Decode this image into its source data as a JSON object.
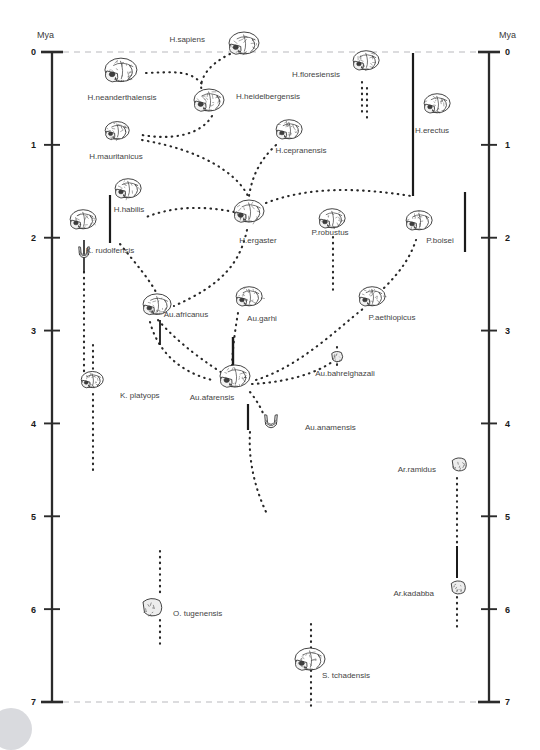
{
  "figure": {
    "kind": "hominin-phylogeny-timeline",
    "background": "#ffffff",
    "ink": "#2b2b2b",
    "label_color": "#444444",
    "axis_unit_left": "Mya",
    "axis_unit_right": "Mya"
  },
  "axes": {
    "label": "Mya",
    "ticks": [
      "0",
      "1",
      "2",
      "3",
      "4",
      "5",
      "6",
      "7"
    ],
    "min": 0,
    "max": 7,
    "left_x": 52,
    "right_x": 489,
    "top_y": 52,
    "bottom_y": 702
  },
  "chart_data": {
    "type": "scatter",
    "title": "",
    "xlabel": "",
    "ylabel": "Mya",
    "ylim": [
      0,
      7
    ],
    "grid": false,
    "legend": "none",
    "categories": [
      "H.sapiens",
      "H.neanderthalensis",
      "H.heidelbergensis",
      "H.floresiensis",
      "H.erectus",
      "H.mauritanicus",
      "H.cepranensis",
      "H.habilis",
      "H.ergaster",
      "K.rudolfensis",
      "P.robustus",
      "P.boisei",
      "P.aethiopicus",
      "Au.africanus",
      "Au.garhi",
      "Au.bahrelghazali",
      "Au.afarensis",
      "Au.anamensis",
      "K.platyops",
      "Ar.ramidus",
      "Ar.kadabba",
      "O.tugenensis",
      "S.tchadensis"
    ],
    "values": [
      0.05,
      0.4,
      0.6,
      0.05,
      0.9,
      1.1,
      1.2,
      1.85,
      1.9,
      2.1,
      1.9,
      1.95,
      2.9,
      2.85,
      2.8,
      3.4,
      3.5,
      4.0,
      3.6,
      4.5,
      5.8,
      6.0,
      6.8
    ],
    "points": [
      {
        "name": "H.sapiens",
        "label": "H.sapiens",
        "x": 245,
        "y": 45,
        "lx": 205,
        "ly": 42,
        "anchor": "end",
        "skull": 30
      },
      {
        "name": "H.neanderthalensis",
        "label": "H.neanderthalensis",
        "x": 122,
        "y": 72,
        "lx": 122,
        "ly": 100,
        "anchor": "middle",
        "skull": 32
      },
      {
        "name": "H.heidelbergensis",
        "label": "H.heidelbergensis",
        "x": 210,
        "y": 102,
        "lx": 236,
        "ly": 99,
        "anchor": "start",
        "skull": 30
      },
      {
        "name": "H.floresiensis",
        "label": "H.floresiensis",
        "x": 367,
        "y": 62,
        "lx": 340,
        "ly": 77,
        "anchor": "end",
        "skull": 26
      },
      {
        "name": "H.erectus",
        "label": "H.erectus",
        "x": 438,
        "y": 105,
        "lx": 432,
        "ly": 133,
        "anchor": "middle",
        "skull": 26
      },
      {
        "name": "H.mauritanicus",
        "label": "H.mauritanicus",
        "x": 118,
        "y": 132,
        "lx": 116,
        "ly": 159,
        "anchor": "middle",
        "skull": 24
      },
      {
        "name": "H.cepranensis",
        "label": "H.cepranensis",
        "x": 290,
        "y": 131,
        "lx": 301,
        "ly": 153,
        "anchor": "middle",
        "skull": 26
      },
      {
        "name": "H.habilis",
        "label": "H.habilis",
        "x": 129,
        "y": 190,
        "lx": 129,
        "ly": 212,
        "anchor": "middle",
        "skull": 26
      },
      {
        "name": "H.ergaster",
        "label": "H.ergaster",
        "x": 250,
        "y": 213,
        "lx": 258,
        "ly": 243,
        "anchor": "middle",
        "skull": 30
      },
      {
        "name": "K.rudolfensis",
        "label": "K. rudolfensis",
        "x": 84,
        "y": 221,
        "lx": 110,
        "ly": 253,
        "anchor": "middle",
        "skull": 26
      },
      {
        "name": "P.robustus",
        "label": "P.robustus",
        "x": 333,
        "y": 220,
        "lx": 330,
        "ly": 235,
        "anchor": "middle",
        "skull": 26
      },
      {
        "name": "P.boisei",
        "label": "P.boisei",
        "x": 420,
        "y": 222,
        "lx": 440,
        "ly": 243,
        "anchor": "middle",
        "skull": 26
      },
      {
        "name": "P.aethiopicus",
        "label": "P.aethiopicus",
        "x": 373,
        "y": 298,
        "lx": 392,
        "ly": 320,
        "anchor": "middle",
        "skull": 26
      },
      {
        "name": "Au.africanus",
        "label": "Au.africanus",
        "x": 158,
        "y": 306,
        "lx": 186,
        "ly": 317,
        "anchor": "middle",
        "skull": 28
      },
      {
        "name": "Au.garhi",
        "label": "Au.garhi",
        "x": 250,
        "y": 298,
        "lx": 262,
        "ly": 321,
        "anchor": "middle",
        "skull": 26
      },
      {
        "name": "Au.bahrelghazali",
        "label": "Au.bahrelghazali",
        "x": 337,
        "y": 357,
        "lx": 345,
        "ly": 376,
        "anchor": "middle",
        "skull": 14
      },
      {
        "name": "Au.afarensis",
        "label": "Au.afarensis",
        "x": 236,
        "y": 378,
        "lx": 212,
        "ly": 400,
        "anchor": "middle",
        "skull": 30
      },
      {
        "name": "Au.anamensis",
        "label": "Au.anamensis",
        "x": 271,
        "y": 421,
        "lx": 305,
        "ly": 430,
        "anchor": "start",
        "skull": 18
      },
      {
        "name": "K.platyops",
        "label": "K. platyops",
        "x": 93,
        "y": 381,
        "lx": 120,
        "ly": 398,
        "anchor": "start",
        "skull": 22
      },
      {
        "name": "Ar.ramidus",
        "label": "Ar.ramidus",
        "x": 459,
        "y": 465,
        "lx": 436,
        "ly": 472,
        "anchor": "end",
        "skull": 18
      },
      {
        "name": "Ar.kadabba",
        "label": "Ar.kadabba",
        "x": 458,
        "y": 588,
        "lx": 434,
        "ly": 596,
        "anchor": "end",
        "skull": 18
      },
      {
        "name": "O.tugenensis",
        "label": "O. tugenensis",
        "x": 152,
        "y": 608,
        "lx": 173,
        "ly": 616,
        "anchor": "start",
        "skull": 24
      },
      {
        "name": "S.tchadensis",
        "label": "S. tchadensis",
        "x": 311,
        "y": 661,
        "lx": 322,
        "ly": 678,
        "anchor": "start",
        "skull": 30
      }
    ],
    "range_bars": [
      {
        "name": "H.erectus-range",
        "x": 413,
        "y1": 53,
        "y2": 196,
        "width": 2.2
      },
      {
        "name": "H.habilis-range",
        "x": 110,
        "y1": 195,
        "y2": 243,
        "width": 2.2
      },
      {
        "name": "P.boisei-range",
        "x": 465,
        "y1": 192,
        "y2": 252,
        "width": 2.2
      },
      {
        "name": "K.rudolfensis-range",
        "x": 84,
        "y1": 240,
        "y2": 272,
        "width": 1.6
      },
      {
        "name": "Au.africanus-range",
        "x": 160,
        "y1": 320,
        "y2": 345,
        "width": 1.8
      },
      {
        "name": "Au.garhi-range",
        "x": 233,
        "y1": 337,
        "y2": 373,
        "width": 2.4
      },
      {
        "name": "Au.anamensis-range",
        "x": 248,
        "y1": 404,
        "y2": 430,
        "width": 2.2
      },
      {
        "name": "Ar.kadabba-range",
        "x": 457,
        "y1": 546,
        "y2": 578,
        "width": 2.0
      }
    ],
    "lineages": [
      {
        "name": "H.erectus-lineage",
        "path": "M367,88 L367,118"
      },
      {
        "name": "K.rudolfensis-lineage",
        "path": "M84,272 L84,385"
      },
      {
        "name": "K.platyops-lineage",
        "path": "M93,345 L93,370"
      },
      {
        "name": "K.platyops-lineage-down",
        "path": "M93,394 L93,470"
      },
      {
        "name": "O.tugenensis-up",
        "path": "M160,551 L160,596"
      },
      {
        "name": "O.tugenensis-down",
        "path": "M160,620 L160,648"
      },
      {
        "name": "S.tchadensis-lineage",
        "path": "M311,624 L311,706"
      },
      {
        "name": "Ar.ramidus-lineage",
        "path": "M457,478 L457,548"
      },
      {
        "name": "Ar.kadabba-lineage",
        "path": "M457,597 L457,630"
      },
      {
        "name": "P.robustus-lineage",
        "path": "M333,237 L333,290"
      },
      {
        "name": "Au.bahrelghazali-lineage",
        "path": "M337,347 L337,368"
      },
      {
        "name": "H.floresiensis-lineage",
        "path": "M362,82 L362,112"
      }
    ],
    "branches": [
      {
        "name": "sapiens-to-heidelbergensis",
        "path": "M230,54 C205,66 196,84 204,96"
      },
      {
        "name": "neanderthal-to-heidelberg",
        "path": "M146,73 C175,72 190,70 202,84"
      },
      {
        "name": "heidelberg-to-mauritanicus",
        "path": "M212,116 C200,136 170,140 142,135"
      },
      {
        "name": "mauritanicus-to-ergaster",
        "path": "M142,140 C200,150 236,172 248,196"
      },
      {
        "name": "cepranensis-to-ergaster",
        "path": "M276,145 C258,162 252,178 249,196"
      },
      {
        "name": "ergaster-to-erectus",
        "path": "M266,203 C310,186 360,188 411,196"
      },
      {
        "name": "ergaster-to-habilis",
        "path": "M234,212 C200,205 170,207 144,218"
      },
      {
        "name": "habilis-to-africanus",
        "path": "M120,244 C136,264 150,280 157,294"
      },
      {
        "name": "ergaster-down-to-africanus",
        "path": "M247,230 C240,262 224,284 174,306"
      },
      {
        "name": "africanus-to-afarensis",
        "path": "M158,320 C180,345 208,364 224,374"
      },
      {
        "name": "garhi-to-afarensis",
        "path": "M238,313 C234,336 232,356 232,368"
      },
      {
        "name": "afarensis-to-bahrelghazali",
        "path": "M252,384 C290,382 318,372 332,362"
      },
      {
        "name": "afarensis-to-aethiopicus",
        "path": "M256,380 C300,366 336,330 364,308"
      },
      {
        "name": "aethiopicus-to-boisei",
        "path": "M384,288 C400,272 410,258 416,240"
      },
      {
        "name": "afarensis-to-anamensis",
        "path": "M250,392 C258,402 262,410 264,416"
      },
      {
        "name": "anamensis-down",
        "path": "M250,432 C248,462 256,492 268,516"
      },
      {
        "name": "africanus-lower-arc",
        "path": "M150,322 C158,352 180,372 212,380"
      }
    ],
    "dashed_guides": [
      {
        "name": "top-dashed-guide",
        "path": "M52,52 L489,52"
      },
      {
        "name": "bottom-dashed-guide",
        "path": "M52,702 L489,702"
      }
    ]
  }
}
